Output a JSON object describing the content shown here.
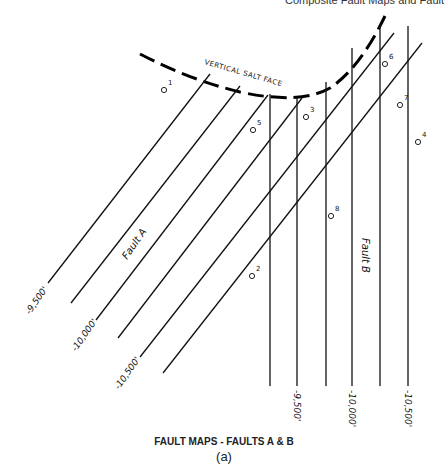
{
  "header_fragment": "Composite Fault Maps and Fault",
  "salt_face": {
    "label": "VERTICAL SALT FACE"
  },
  "faults": {
    "A": {
      "label": "Fault A"
    },
    "B": {
      "label": "Fault B"
    }
  },
  "fault_a_contours": [
    {
      "label": "-9,500'"
    },
    {
      "label": ""
    },
    {
      "label": "-10,000'"
    },
    {
      "label": ""
    },
    {
      "label": "-10,500'"
    },
    {
      "label": ""
    }
  ],
  "fault_b_contours": [
    {
      "label": ""
    },
    {
      "label": "-9,500'"
    },
    {
      "label": ""
    },
    {
      "label": "-10,000'"
    },
    {
      "label": ""
    },
    {
      "label": "-10,500'"
    }
  ],
  "wells": [
    {
      "id": "1"
    },
    {
      "id": "2"
    },
    {
      "id": "3"
    },
    {
      "id": "4"
    },
    {
      "id": "5"
    },
    {
      "id": "6"
    },
    {
      "id": "7"
    },
    {
      "id": "8"
    }
  ],
  "caption": "FAULT MAPS - FAULTS A & B",
  "sublabel": "(a)"
}
